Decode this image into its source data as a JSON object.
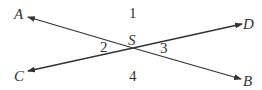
{
  "diagram": {
    "intersection": {
      "label": "S"
    },
    "points": [
      {
        "id": "A",
        "label": "A"
      },
      {
        "id": "B",
        "label": "B"
      },
      {
        "id": "C",
        "label": "C"
      },
      {
        "id": "D",
        "label": "D"
      }
    ],
    "angles": [
      {
        "id": "1",
        "label": "1"
      },
      {
        "id": "2",
        "label": "2"
      },
      {
        "id": "3",
        "label": "3"
      },
      {
        "id": "4",
        "label": "4"
      }
    ],
    "line_color": "#333333"
  }
}
